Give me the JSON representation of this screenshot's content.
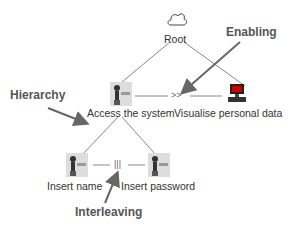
{
  "diagram": {
    "nodes": {
      "root": {
        "label": "Root",
        "icon": "cloud-icon"
      },
      "access": {
        "label": "Access the system",
        "icon": "user-task-icon"
      },
      "visualise": {
        "label": "Visualise personal data",
        "icon": "computer-icon"
      },
      "insert_name": {
        "label": "Insert name",
        "icon": "user-task-icon"
      },
      "insert_password": {
        "label": "Insert password",
        "icon": "user-task-icon"
      }
    },
    "operators": {
      "enabling": ">>",
      "interleaving": "|||"
    },
    "annotations": {
      "enabling": "Enabling",
      "hierarchy": "Hierarchy",
      "interleaving": "Interleaving"
    },
    "colors": {
      "line": "#888888",
      "arrow": "#666666",
      "text": "#333333",
      "annotation": "#555555"
    }
  }
}
